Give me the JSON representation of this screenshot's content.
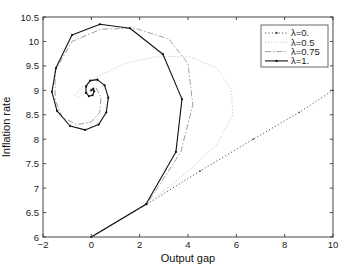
{
  "chart_data": {
    "type": "line",
    "title": "",
    "xlabel": "Output gap",
    "ylabel": "Inflation rate",
    "xlim": [
      -2,
      10
    ],
    "ylim": [
      6,
      10.5
    ],
    "xticks": [
      -2,
      0,
      2,
      4,
      6,
      8,
      10
    ],
    "xtick_labels": [
      "−2",
      "0",
      "2",
      "4",
      "6",
      "8",
      "10"
    ],
    "yticks": [
      6,
      6.5,
      7,
      7.5,
      8,
      8.5,
      9,
      9.5,
      10,
      10.5
    ],
    "ytick_labels": [
      "6",
      "6.5",
      "7",
      "7.5",
      "8",
      "8.5",
      "9",
      "9.5",
      "10",
      "10.5"
    ],
    "grid": false,
    "legend_position": "upper right",
    "series": [
      {
        "name": "λ=0.",
        "style": "dotted",
        "color": "#555555",
        "x": [
          0,
          2.3,
          4.5,
          6.7,
          8.6,
          10
        ],
        "y": [
          6,
          6.67,
          7.35,
          8.0,
          8.55,
          9.0
        ]
      },
      {
        "name": "λ=0.5",
        "style": "dotted-light",
        "color": "#c8c8c8",
        "x": [
          0,
          2.3,
          3.9,
          5.2,
          5.85,
          5.8,
          5.2,
          4.1,
          2.8,
          1.4,
          0.3,
          -0.4,
          -0.7,
          -0.6,
          -0.2,
          0.1
        ],
        "y": [
          6,
          6.67,
          7.3,
          7.9,
          8.5,
          9.0,
          9.45,
          9.68,
          9.7,
          9.55,
          9.3,
          9.05,
          8.9,
          8.85,
          8.95,
          9.0
        ]
      },
      {
        "name": "λ=0.75",
        "style": "dashdot",
        "color": "#a0a0a0",
        "x": [
          0,
          2.3,
          3.7,
          4.2,
          4.0,
          3.2,
          1.8,
          0.4,
          -0.8,
          -1.5,
          -1.5,
          -1.2,
          -0.6,
          0.0,
          0.35,
          0.4,
          0.2,
          0.0,
          -0.05,
          0.0
        ],
        "y": [
          6,
          6.67,
          7.74,
          8.7,
          9.55,
          10.05,
          10.27,
          10.25,
          10.0,
          9.4,
          8.8,
          8.45,
          8.3,
          8.35,
          8.55,
          8.85,
          9.05,
          9.05,
          9.0,
          9.0
        ]
      },
      {
        "name": "λ=1.",
        "style": "solid-marker",
        "color": "#111111",
        "x": [
          0,
          2.26,
          3.5,
          3.75,
          2.96,
          1.6,
          0.36,
          -0.8,
          -1.46,
          -1.63,
          -1.42,
          -0.88,
          -0.26,
          0.3,
          0.62,
          0.7,
          0.55,
          0.25,
          -0.05,
          -0.22,
          -0.22,
          -0.1,
          0.05,
          0.12,
          0.08,
          0.0
        ],
        "y": [
          6,
          6.67,
          7.74,
          8.82,
          9.74,
          10.27,
          10.35,
          10.13,
          9.46,
          8.97,
          8.58,
          8.27,
          8.19,
          8.3,
          8.55,
          8.85,
          9.1,
          9.22,
          9.2,
          9.08,
          8.95,
          8.88,
          8.9,
          8.98,
          9.03,
          9.0
        ]
      }
    ]
  }
}
